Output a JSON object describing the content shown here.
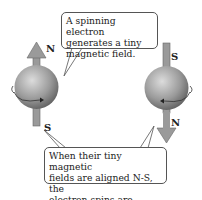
{
  "diagram": {
    "top_callout": {
      "lines": [
        "A spinning electron",
        "generates a tiny",
        "magnetic field."
      ]
    },
    "bottom_callout": {
      "lines": [
        "When their tiny magnetic",
        "fields are aligned N-S, the",
        "electron spins are paired."
      ]
    },
    "left_electron": {
      "top_pole": "N",
      "bottom_pole": "S",
      "arrow_direction": "up"
    },
    "right_electron": {
      "top_pole": "S",
      "bottom_pole": "N",
      "arrow_direction": "down"
    },
    "colors": {
      "arrow": "#9a9a9a",
      "sphere_light": "#d8d8d8",
      "sphere_dark": "#6a6a6a",
      "border": "#555555"
    }
  }
}
